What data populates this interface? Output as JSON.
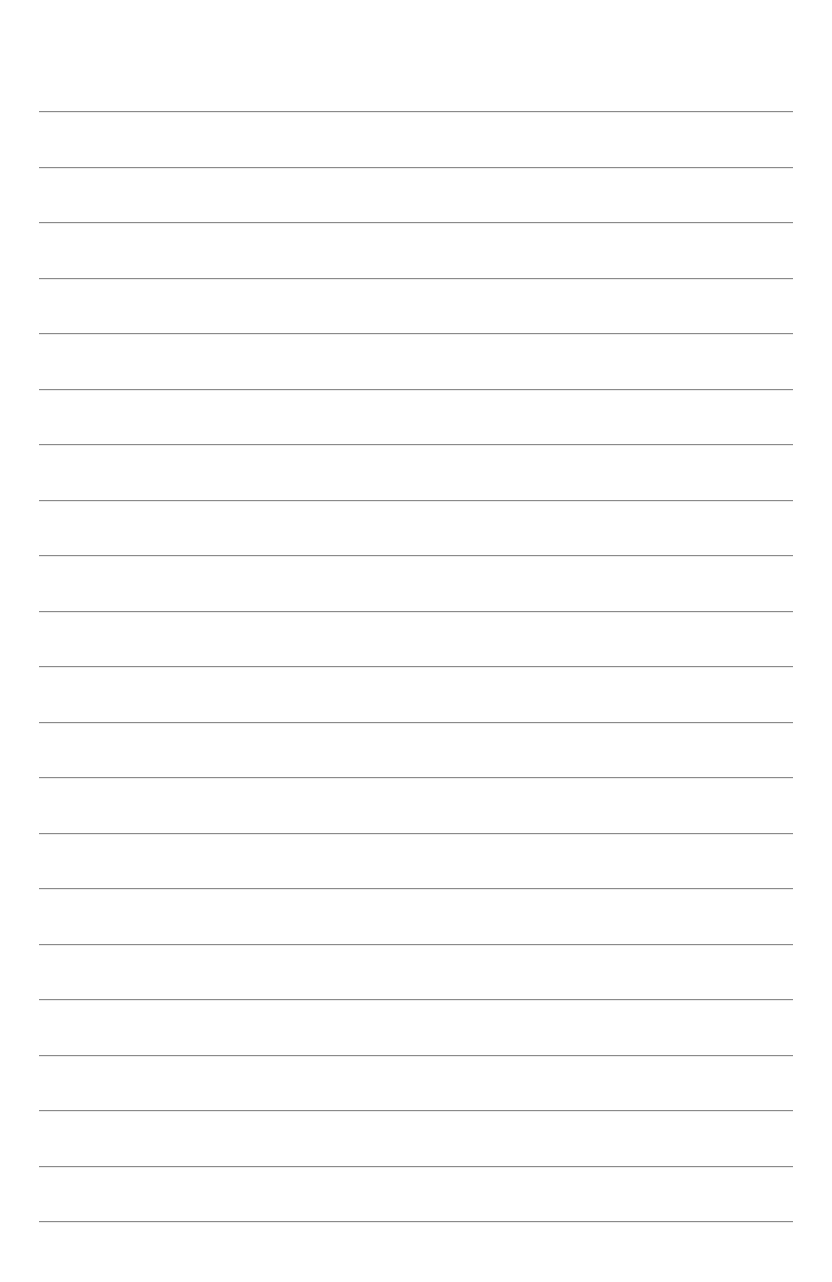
{
  "page": {
    "type": "blank-lined-paper",
    "background_color": "#ffffff",
    "rule_color": "#8a8a8a",
    "rule_count": 21,
    "rule_left_px": 39,
    "rule_right_px": 793,
    "first_rule_y_px": 111,
    "last_rule_y_px": 1221,
    "rule_spacing_px": 55.5
  }
}
